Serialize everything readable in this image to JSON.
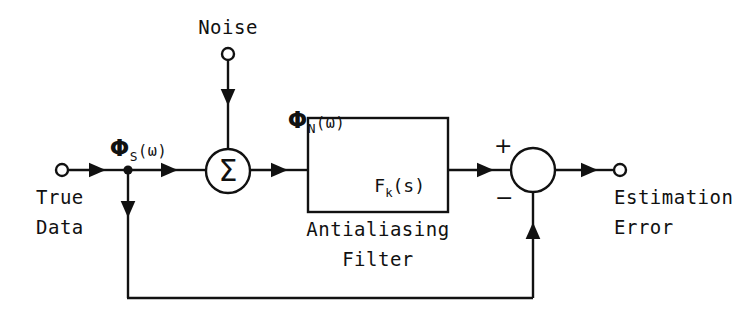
{
  "diagram": {
    "stroke_color": "#111111",
    "background_color": "#ffffff",
    "nodes": {
      "input_terminal": {
        "label_psd": "Φ",
        "label_sub": "S",
        "label_arg": "(ω)",
        "name_line1": "True",
        "name_line2": "Data"
      },
      "noise_terminal": {
        "label": "Noise",
        "label_psd": "Φ",
        "label_sub": "N",
        "label_arg": "(ω)"
      },
      "summing_junction": {
        "symbol": "Σ"
      },
      "filter_block": {
        "symbol_main": "F",
        "symbol_sub": "k",
        "symbol_arg": "(s)",
        "caption_line1": "Antialiasing",
        "caption_line2": "Filter"
      },
      "comparator": {
        "plus_sign": "+",
        "minus_sign": "−"
      },
      "output_terminal": {
        "name_line1": "Estimation",
        "name_line2": "Error"
      }
    }
  }
}
